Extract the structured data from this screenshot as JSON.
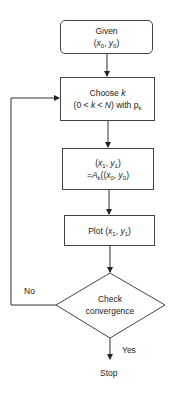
{
  "diagram": {
    "type": "flowchart",
    "nodes": [
      {
        "id": "start",
        "shape": "rounded-rect",
        "lines": [
          "Given",
          "(x0, y0)"
        ]
      },
      {
        "id": "choose",
        "shape": "rect",
        "lines": [
          "Choose k",
          "(0<k<N) with pk"
        ]
      },
      {
        "id": "apply",
        "shape": "rect",
        "lines": [
          "(x1, y1)",
          "=Ak((x0, y0)"
        ]
      },
      {
        "id": "plot",
        "shape": "rect",
        "lines": [
          "Plot (x1, y1)"
        ]
      },
      {
        "id": "check",
        "shape": "diamond",
        "lines": [
          "Check",
          "convergence"
        ]
      },
      {
        "id": "stop",
        "shape": "terminal-text",
        "lines": [
          "Stop"
        ]
      }
    ],
    "edges": [
      {
        "from": "start",
        "to": "choose",
        "label": ""
      },
      {
        "from": "choose",
        "to": "apply",
        "label": ""
      },
      {
        "from": "apply",
        "to": "plot",
        "label": ""
      },
      {
        "from": "plot",
        "to": "check",
        "label": ""
      },
      {
        "from": "check",
        "to": "choose",
        "label": "No"
      },
      {
        "from": "check",
        "to": "stop",
        "label": "Yes"
      }
    ],
    "labels": {
      "given": "Given",
      "x": "x",
      "y": "y",
      "sub0": "0",
      "sub1": "1",
      "choose": "Choose",
      "k": "k",
      "zero_lt": "(0 <",
      "lt": "<",
      "N": "N",
      "with_p": ") with p",
      "A": "A",
      "plot": "Plot",
      "check": "Check",
      "convergence": "convergence",
      "no": "No",
      "yes": "Yes",
      "stop": "Stop"
    }
  }
}
